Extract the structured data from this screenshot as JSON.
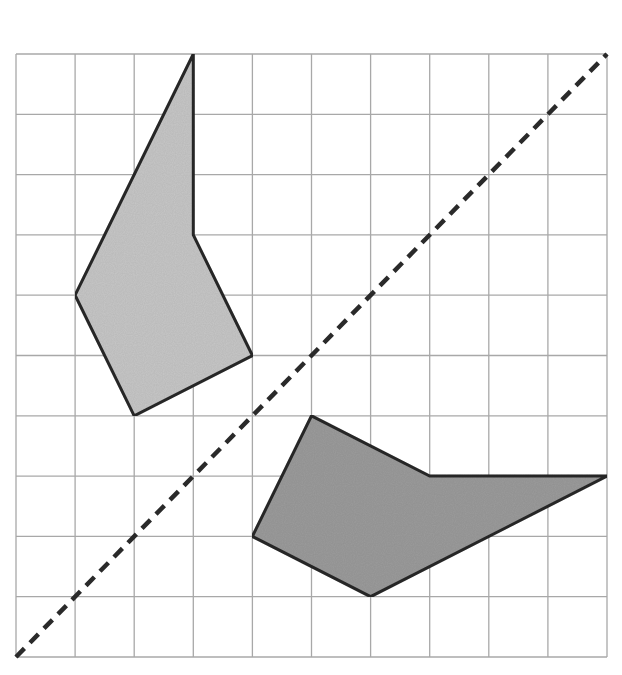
{
  "diagram": {
    "type": "reflection-grid",
    "grid": {
      "columns": 10,
      "rows": 10,
      "origin_px": [
        16,
        54
      ],
      "cell_w_px": 59.1,
      "cell_h_px": 60.3,
      "line_color": "#a8a8a8"
    },
    "line_of_reflection": {
      "style": "dashed",
      "color": "#2a2a2a",
      "from": [
        0,
        10
      ],
      "to": [
        10,
        0
      ]
    },
    "shapes": [
      {
        "name": "light-polygon",
        "fill": "#c8c8c8",
        "vertices": [
          [
            3,
            0
          ],
          [
            3,
            3
          ],
          [
            4,
            5
          ],
          [
            2,
            6
          ],
          [
            1,
            4
          ]
        ]
      },
      {
        "name": "dark-polygon",
        "fill": "#9c9c9c",
        "vertices": [
          [
            5,
            6
          ],
          [
            7,
            7
          ],
          [
            10,
            7
          ],
          [
            6,
            9
          ],
          [
            4,
            8
          ]
        ]
      }
    ]
  }
}
